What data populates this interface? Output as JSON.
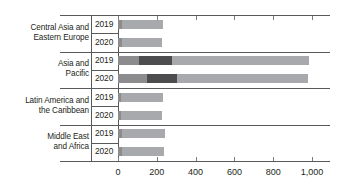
{
  "chart_data": {
    "type": "bar",
    "orientation": "horizontal",
    "stacked": true,
    "title": "",
    "subtitle": "",
    "xlabel": "",
    "ylabel": "",
    "xlim": [
      0,
      1000
    ],
    "xticks": [
      0,
      200,
      400,
      600,
      800,
      1000
    ],
    "xtick_labels": [
      "0",
      "200",
      "400",
      "600",
      "800",
      "1,000"
    ],
    "grid": false,
    "legend": null,
    "legend_position": "none",
    "categories": [
      "Central Asia and Eastern Europe",
      "Asia and Pacific",
      "Latin America and the Caribbean",
      "Middle East and Africa"
    ],
    "subcategories": [
      "2019",
      "2020"
    ],
    "series": [
      {
        "name": "segment-1",
        "color": "#8c8c8e"
      },
      {
        "name": "segment-2",
        "color": "#4d4d4f"
      },
      {
        "name": "segment-3",
        "color": "#a7a9ac"
      }
    ],
    "groups": [
      {
        "label_line1": "Central Asia and",
        "label_line2": "Eastern Europe",
        "rows": [
          {
            "year": "2019",
            "values": [
              20,
              0,
              210
            ],
            "total": 230
          },
          {
            "year": "2020",
            "values": [
              20,
              0,
              208
            ],
            "total": 228
          }
        ]
      },
      {
        "label_line1": "Asia and",
        "label_line2": "Pacific",
        "rows": [
          {
            "year": "2019",
            "values": [
              110,
              170,
              705
            ],
            "total": 985
          },
          {
            "year": "2020",
            "values": [
              150,
              155,
              675
            ],
            "total": 980
          }
        ]
      },
      {
        "label_line1": "Latin America and",
        "label_line2": "the Caribbean",
        "rows": [
          {
            "year": "2019",
            "values": [
              15,
              0,
              215
            ],
            "total": 230
          },
          {
            "year": "2020",
            "values": [
              15,
              0,
              213
            ],
            "total": 228
          }
        ]
      },
      {
        "label_line1": "Middle East",
        "label_line2": "and Africa",
        "rows": [
          {
            "year": "2019",
            "values": [
              22,
              0,
              218
            ],
            "total": 240
          },
          {
            "year": "2020",
            "values": [
              22,
              0,
              216
            ],
            "total": 238
          }
        ]
      }
    ]
  },
  "axis": {
    "tick_labels": [
      "0",
      "200",
      "400",
      "600",
      "800",
      "1,000"
    ]
  },
  "colors": {
    "segment_1": "#8c8c8e",
    "segment_2": "#4d4d4f",
    "segment_3": "#a7a9ac",
    "axis": "#58595b",
    "text": "#231f20"
  }
}
